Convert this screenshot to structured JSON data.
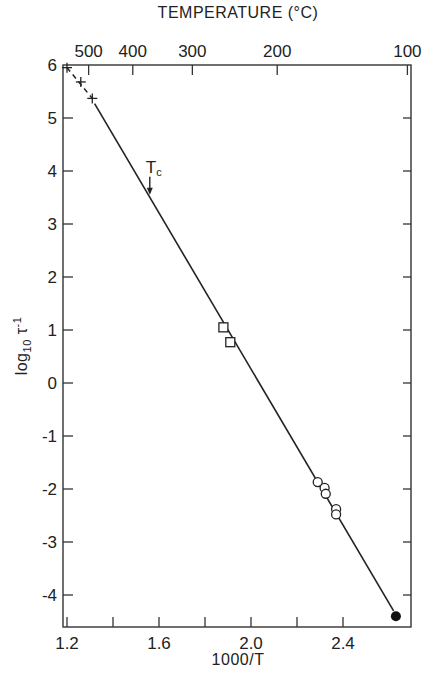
{
  "chart_data": {
    "type": "scatter",
    "title": "",
    "xlabel": "1000/T",
    "ylabel": "log10 τ^-1",
    "top_axis_label": "TEMPERATURE (°C)",
    "xlim": [
      1.2,
      2.66
    ],
    "ylim": [
      -4.6,
      6.0
    ],
    "grid": false,
    "x_ticks": [
      1.2,
      1.4,
      1.6,
      1.8,
      2.0,
      2.2,
      2.4
    ],
    "x_tick_labels": [
      "1.2",
      "",
      "1.6",
      "",
      "2.0",
      "",
      "2.4"
    ],
    "y_ticks": [
      6,
      5,
      4,
      3,
      2,
      1,
      0,
      -1,
      -2,
      -3,
      -4
    ],
    "y_tick_labels": [
      "6",
      "5",
      "4",
      "3",
      "2",
      "1",
      "0",
      "-1",
      "-2",
      "-3",
      "-4"
    ],
    "top_ticks": [
      {
        "label": "500",
        "x": 1.294
      },
      {
        "label": "400",
        "x": 1.486
      },
      {
        "label": "300",
        "x": 1.745
      },
      {
        "label": "200",
        "x": 2.114
      },
      {
        "label": "100",
        "x": 2.68
      }
    ],
    "series": [
      {
        "name": "cross",
        "marker": "+",
        "x": [
          1.2,
          1.26,
          1.31
        ],
        "y": [
          5.95,
          5.68,
          5.37
        ]
      },
      {
        "name": "square",
        "marker": "square-open",
        "x": [
          1.88,
          1.91
        ],
        "y": [
          1.05,
          0.77
        ]
      },
      {
        "name": "circle",
        "marker": "circle-open",
        "x": [
          2.29,
          2.32,
          2.325,
          2.37,
          2.37
        ],
        "y": [
          -1.87,
          -1.98,
          -2.09,
          -2.38,
          -2.48
        ]
      },
      {
        "name": "filled",
        "marker": "circle-filled",
        "x": [
          2.63
        ],
        "y": [
          -4.4
        ]
      }
    ],
    "fit_line": {
      "dashed_segment": {
        "x": [
          1.2,
          1.31
        ],
        "y": [
          5.95,
          5.37
        ]
      },
      "solid_segment": {
        "x": [
          1.32,
          2.62
        ],
        "y": [
          5.27,
          -4.3
        ]
      }
    },
    "annotations": [
      {
        "text": "Tc",
        "x": 1.56,
        "y": 3.55,
        "arrow": "down"
      }
    ]
  }
}
